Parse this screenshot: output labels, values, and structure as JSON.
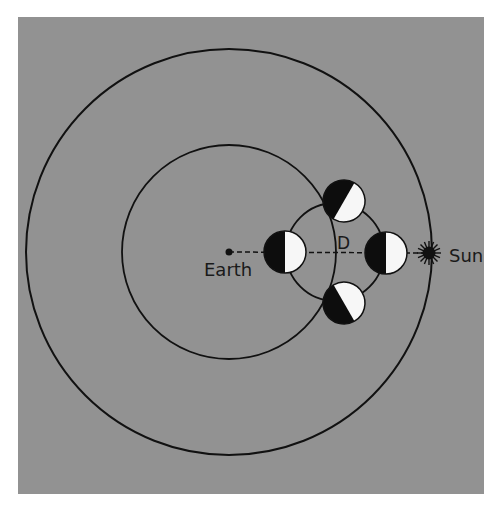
{
  "diagram": {
    "background_color": "#929292",
    "line_color": "#111111",
    "moon_dark_color": "#0d0d0d",
    "moon_light_color": "#f7f7f7",
    "labels": {
      "earth": "Earth",
      "sun": "Sun",
      "distance": "D"
    },
    "elements": {
      "outer_orbit": {
        "cx": 229,
        "cy": 252,
        "r": 203
      },
      "inner_orbit": {
        "cx": 229,
        "cy": 252,
        "r": 107
      },
      "moon_orbit": {
        "cx": 335,
        "cy": 252,
        "r": 49
      },
      "earth": {
        "cx": 229,
        "cy": 252,
        "r": 3.5
      },
      "sun": {
        "cx": 429,
        "cy": 253,
        "r_core": 6.5,
        "r_rays": 11
      },
      "moons": [
        {
          "name": "left",
          "cx": 285,
          "cy": 252,
          "r": 21,
          "dark_side_angle": 180
        },
        {
          "name": "right",
          "cx": 386,
          "cy": 253,
          "r": 21,
          "dark_side_angle": 180
        },
        {
          "name": "top",
          "cx": 344,
          "cy": 201,
          "r": 21,
          "dark_side_angle": 210
        },
        {
          "name": "bottom",
          "cx": 344,
          "cy": 303,
          "r": 21,
          "dark_side_angle": 150
        }
      ]
    }
  }
}
